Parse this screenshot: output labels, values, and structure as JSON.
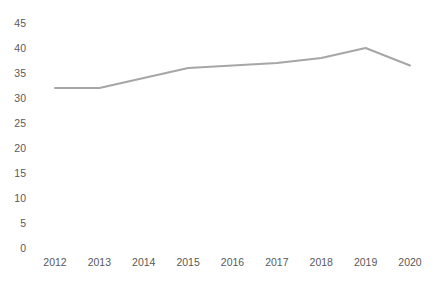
{
  "chart_data": {
    "type": "line",
    "title": "",
    "xlabel": "",
    "ylabel": "",
    "categories": [
      "2012",
      "2013",
      "2014",
      "2015",
      "2016",
      "2017",
      "2018",
      "2019",
      "2020"
    ],
    "series": [
      {
        "name": "series-1",
        "values": [
          32,
          32,
          34,
          36,
          36.5,
          37,
          38,
          40,
          36.5
        ]
      }
    ],
    "ylim": [
      0,
      45
    ],
    "y_tick_step": 5,
    "y_tick_labels": [
      "0",
      "5",
      "10",
      "15",
      "20",
      "25",
      "30",
      "35",
      "40",
      "45"
    ],
    "grid": false,
    "legend": "none",
    "axis_lines": false,
    "colors": {
      "line": "#a6a6a6",
      "labels": "#595959",
      "background": "#ffffff"
    }
  }
}
